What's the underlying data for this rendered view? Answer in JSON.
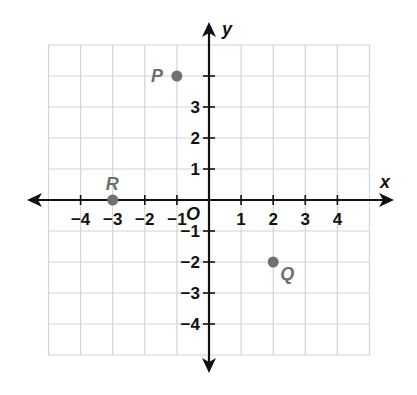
{
  "chart_data": {
    "type": "scatter",
    "title": "",
    "xlabel": "x",
    "ylabel": "y",
    "origin_label": "O",
    "xlim": [
      -5,
      5
    ],
    "ylim": [
      -5,
      5
    ],
    "grid": true,
    "x_tick_labels": [
      "−4",
      "−3",
      "−2",
      "−1",
      "1",
      "2",
      "3",
      "4"
    ],
    "x_tick_values": [
      -4,
      -3,
      -2,
      -1,
      1,
      2,
      3,
      4
    ],
    "y_tick_labels": [
      "3",
      "2",
      "1",
      "−1",
      "−2",
      "−3",
      "−4"
    ],
    "y_tick_values": [
      3,
      2,
      1,
      -1,
      -2,
      -3,
      -4
    ],
    "points": [
      {
        "name": "P",
        "x": -1,
        "y": 4
      },
      {
        "name": "R",
        "x": -3,
        "y": 0
      },
      {
        "name": "Q",
        "x": 2,
        "y": -2
      }
    ]
  },
  "colors": {
    "grid": "#d4d4d4",
    "axis": "#111111",
    "point": "#707070",
    "point_label": "#6e6e6e"
  }
}
